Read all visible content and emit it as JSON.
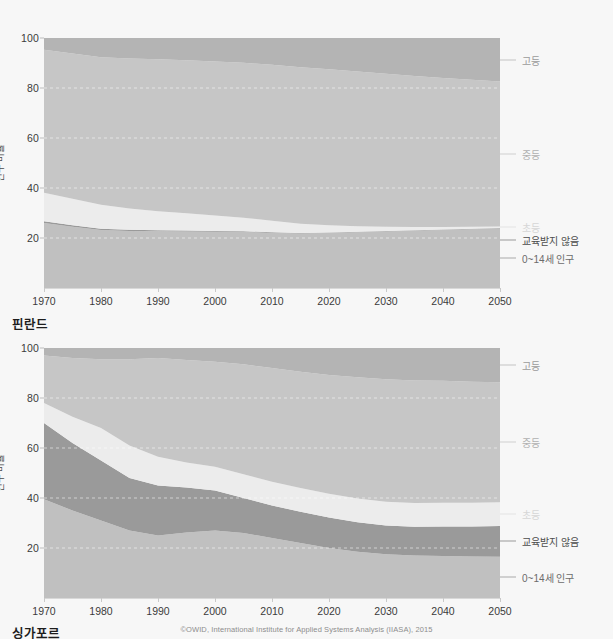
{
  "footer": {
    "credit": "©OWID, International Institute for Applied Systems Analysis (IIASA), 2015"
  },
  "axis": {
    "ylabel": "인구 비율",
    "yticks": [
      100,
      80,
      60,
      40,
      20
    ],
    "xticks": [
      1970,
      1980,
      1990,
      2000,
      2010,
      2020,
      2030,
      2040,
      2050
    ]
  },
  "series_labels": {
    "tertiary": "고등",
    "secondary": "중등",
    "primary": "초등",
    "no_education": "교육받지 않음",
    "age_0_14": "0~14세 인구"
  },
  "colors": {
    "background": "#f7f7f7",
    "tertiary": "#b4b4b4",
    "secondary": "#c6c6c6",
    "primary": "#ececec",
    "no_education": "#9a9a9a",
    "age_0_14": "#c0c0c0",
    "label_tertiary": "#9b9b9b",
    "label_secondary": "#b0b0b0",
    "label_primary": "#d6d6d6",
    "label_no_education": "#4d4d4d",
    "label_age_0_14": "#6b6b6b",
    "gridline": "#e8e8e8",
    "tick_text": "#3b3b3b"
  },
  "chart_data": [
    {
      "type": "area",
      "title": "핀란드",
      "country": "핀란드",
      "xlabel": "",
      "ylabel": "인구 비율",
      "xlim": [
        1970,
        2050
      ],
      "ylim": [
        0,
        100
      ],
      "grid": true,
      "legend_position": "right",
      "stacked": true,
      "x": [
        1970,
        1975,
        1980,
        1985,
        1990,
        1995,
        2000,
        2005,
        2010,
        2015,
        2020,
        2025,
        2030,
        2035,
        2040,
        2045,
        2050
      ],
      "series": [
        {
          "name": "0~14세 인구",
          "values": [
            26.0,
            24.5,
            23.2,
            22.8,
            22.7,
            22.6,
            22.5,
            22.4,
            22.0,
            21.8,
            22.0,
            22.3,
            22.6,
            22.9,
            23.2,
            23.5,
            23.8
          ]
        },
        {
          "name": "교육받지 않음",
          "values": [
            0.7,
            0.6,
            0.5,
            0.5,
            0.4,
            0.4,
            0.3,
            0.3,
            0.3,
            0.2,
            0.2,
            0.2,
            0.2,
            0.2,
            0.2,
            0.2,
            0.2
          ]
        },
        {
          "name": "초등",
          "values": [
            11.4,
            10.6,
            9.6,
            8.5,
            7.6,
            6.9,
            6.2,
            5.4,
            4.6,
            3.7,
            2.9,
            2.2,
            1.7,
            1.3,
            1.0,
            0.8,
            0.6
          ]
        },
        {
          "name": "중등",
          "values": [
            57.2,
            58.1,
            59.0,
            60.0,
            60.8,
            61.2,
            61.6,
            62.0,
            62.4,
            62.6,
            62.4,
            61.9,
            61.2,
            60.4,
            59.6,
            58.8,
            58.0
          ]
        },
        {
          "name": "고등",
          "values": [
            4.7,
            6.2,
            7.7,
            8.2,
            8.5,
            8.9,
            9.4,
            9.9,
            10.7,
            11.7,
            12.5,
            13.4,
            14.3,
            15.2,
            16.0,
            16.7,
            17.4
          ]
        }
      ]
    },
    {
      "type": "area",
      "title": "싱가포르",
      "country": "싱가포르",
      "xlabel": "",
      "ylabel": "인구 비율",
      "xlim": [
        1970,
        2050
      ],
      "ylim": [
        0,
        100
      ],
      "grid": true,
      "legend_position": "right",
      "stacked": true,
      "x": [
        1970,
        1975,
        1980,
        1985,
        1990,
        1995,
        2000,
        2005,
        2010,
        2015,
        2020,
        2025,
        2030,
        2035,
        2040,
        2045,
        2050
      ],
      "series": [
        {
          "name": "0~14세 인구",
          "values": [
            39.5,
            35.0,
            31.0,
            27.0,
            25.0,
            26.2,
            27.0,
            26.0,
            24.0,
            22.0,
            20.0,
            18.5,
            17.5,
            17.0,
            16.8,
            16.6,
            16.5
          ]
        },
        {
          "name": "교육받지 않음",
          "values": [
            30.5,
            27.0,
            24.0,
            21.0,
            20.0,
            18.0,
            16.0,
            14.0,
            13.0,
            12.5,
            12.2,
            11.8,
            11.5,
            11.5,
            11.8,
            12.0,
            12.3
          ]
        },
        {
          "name": "초등",
          "values": [
            8.0,
            10.5,
            13.0,
            13.0,
            11.5,
            10.0,
            9.5,
            9.5,
            9.5,
            9.5,
            9.5,
            9.5,
            9.5,
            9.5,
            9.5,
            9.5,
            9.5
          ]
        },
        {
          "name": "중등",
          "values": [
            19.0,
            23.5,
            27.5,
            34.5,
            39.5,
            41.0,
            42.0,
            44.0,
            45.5,
            46.5,
            47.5,
            48.5,
            49.0,
            49.0,
            48.8,
            48.4,
            48.0
          ]
        },
        {
          "name": "고등",
          "values": [
            3.0,
            4.0,
            4.5,
            4.5,
            4.0,
            4.8,
            5.5,
            6.5,
            8.0,
            9.5,
            10.8,
            11.7,
            12.5,
            13.0,
            13.1,
            13.5,
            13.7
          ]
        }
      ]
    }
  ]
}
